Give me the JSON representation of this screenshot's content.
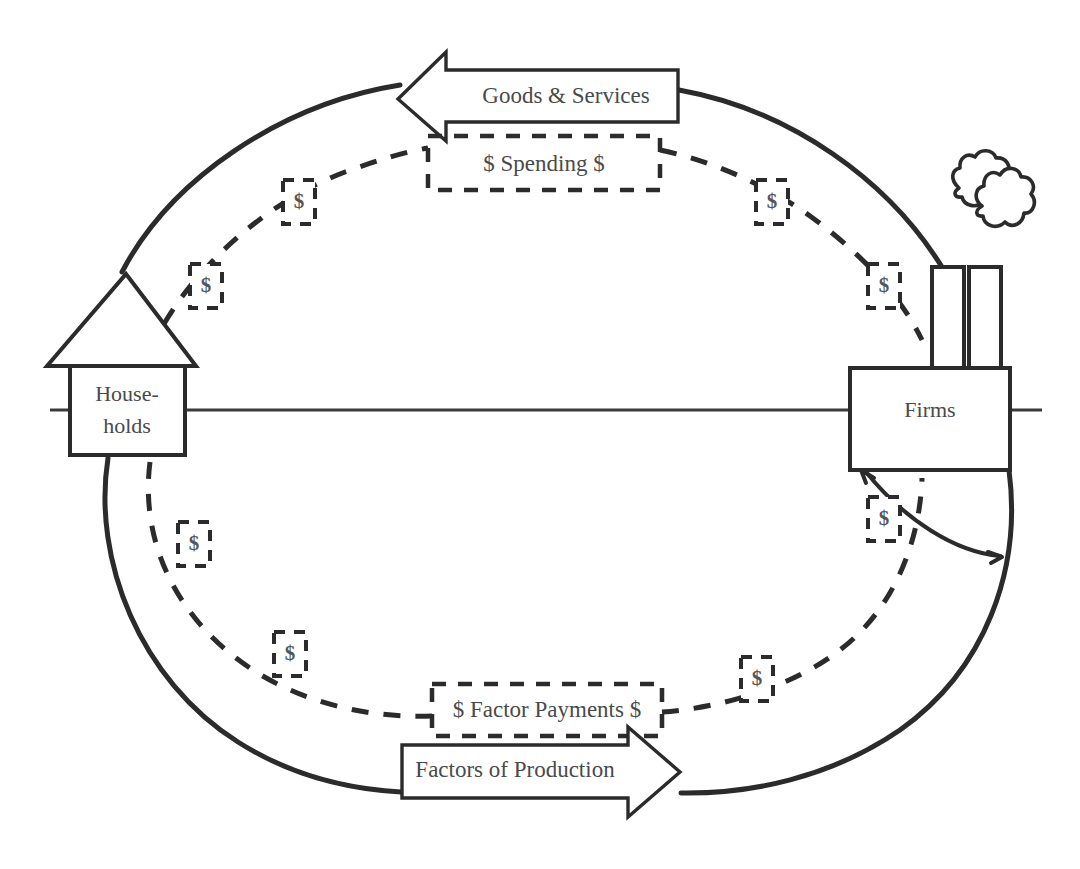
{
  "diagram": {
    "type": "economic-circular-flow",
    "colors": {
      "ink": "#2b2b2b",
      "text": "#4a4a4a",
      "background": "#ffffff"
    },
    "nodes": {
      "households": {
        "name": "Households",
        "label_line1": "House-",
        "label_line2": "holds",
        "icon": "house-icon"
      },
      "firms": {
        "name": "Firms",
        "label": "Firms",
        "icon": "factory-icon"
      }
    },
    "flows": {
      "goods_services": {
        "label": "Goods & Services",
        "direction": "right-to-left",
        "style": "solid-arrow",
        "from": "firms",
        "to": "households"
      },
      "spending": {
        "label": "$ Spending $",
        "direction": "left-to-right",
        "style": "dashed-box",
        "from": "households",
        "to": "firms"
      },
      "factor_payments": {
        "label": "$ Factor Payments $",
        "direction": "right-to-left",
        "style": "dashed-box",
        "from": "firms",
        "to": "households"
      },
      "factors_of_production": {
        "label": "Factors of Production",
        "direction": "left-to-right",
        "style": "solid-arrow",
        "from": "households",
        "to": "firms"
      }
    },
    "money_markers": {
      "symbol": "$",
      "count": 8,
      "positions": [
        {
          "id": "money-marker-upper-left-low",
          "x": 205,
          "y": 288
        },
        {
          "id": "money-marker-upper-left-high",
          "x": 298,
          "y": 203
        },
        {
          "id": "money-marker-upper-right-high",
          "x": 772,
          "y": 203
        },
        {
          "id": "money-marker-upper-right-low",
          "x": 884,
          "y": 288
        },
        {
          "id": "money-marker-lower-left-high",
          "x": 194,
          "y": 545
        },
        {
          "id": "money-marker-lower-left-low",
          "x": 290,
          "y": 655
        },
        {
          "id": "money-marker-lower-right-low",
          "x": 757,
          "y": 680
        },
        {
          "id": "money-marker-lower-right-high",
          "x": 884,
          "y": 520
        }
      ]
    }
  }
}
